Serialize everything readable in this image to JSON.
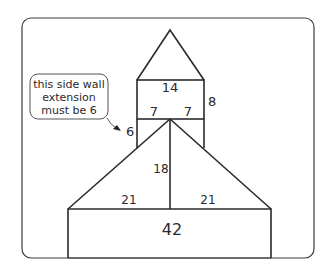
{
  "diagram": {
    "type": "house-shaped composite figure with dimension labels",
    "labels": {
      "top_rect_width": "14",
      "top_rect_height": "8",
      "top_rect_left_half": "7",
      "top_rect_right_half": "7",
      "side_wall_extension": "6",
      "triangle_height": "18",
      "triangle_left_half": "21",
      "triangle_right_half": "21",
      "bottom_rect_width": "42"
    },
    "callout": {
      "lines": [
        "this side wall",
        "extension",
        "must be 6"
      ]
    },
    "colors": {
      "stroke": "#2b2b2b",
      "background": "#ffffff"
    }
  }
}
